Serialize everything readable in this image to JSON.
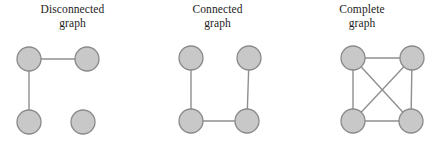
{
  "figure": {
    "background_color": "#ffffff",
    "node_fill_color": "#c8c8c8",
    "node_stroke_color": "#8a8a8a",
    "edge_color": "#8f8f8f",
    "node_radius": 12
  },
  "panels": [
    {
      "id": "disconnected",
      "title": "Disconnected\ngraph",
      "title_line1": "Disconnected",
      "title_line2": "graph",
      "nodes": [
        {
          "id": "tl",
          "cx": 29,
          "cy": 59
        },
        {
          "id": "tr",
          "cx": 87,
          "cy": 59
        },
        {
          "id": "bl",
          "cx": 29,
          "cy": 122
        },
        {
          "id": "br",
          "cx": 83,
          "cy": 122
        }
      ],
      "edges": [
        {
          "from": "tl",
          "to": "tr"
        },
        {
          "from": "tl",
          "to": "bl"
        }
      ],
      "edge_count": 2,
      "node_count": 4
    },
    {
      "id": "connected",
      "title": "Connected\ngraph",
      "title_line1": "Connected",
      "title_line2": "graph",
      "nodes": [
        {
          "id": "tl",
          "cx": 191,
          "cy": 58
        },
        {
          "id": "tr",
          "cx": 249,
          "cy": 58
        },
        {
          "id": "bl",
          "cx": 191,
          "cy": 121
        },
        {
          "id": "br",
          "cx": 247,
          "cy": 121
        }
      ],
      "edges": [
        {
          "from": "tl",
          "to": "bl"
        },
        {
          "from": "tr",
          "to": "br"
        },
        {
          "from": "bl",
          "to": "br"
        }
      ],
      "edge_count": 3,
      "node_count": 4
    },
    {
      "id": "complete",
      "title": "Complete\ngraph",
      "title_line1": "Complete",
      "title_line2": "graph",
      "nodes": [
        {
          "id": "tl",
          "cx": 353,
          "cy": 58
        },
        {
          "id": "tr",
          "cx": 412,
          "cy": 58
        },
        {
          "id": "bl",
          "cx": 353,
          "cy": 121
        },
        {
          "id": "br",
          "cx": 411,
          "cy": 121
        }
      ],
      "edges": [
        {
          "from": "tl",
          "to": "tr"
        },
        {
          "from": "tl",
          "to": "bl"
        },
        {
          "from": "tr",
          "to": "br"
        },
        {
          "from": "bl",
          "to": "br"
        },
        {
          "from": "tl",
          "to": "br"
        },
        {
          "from": "tr",
          "to": "bl"
        }
      ],
      "edge_count": 6,
      "node_count": 4
    }
  ],
  "panel_boxes": [
    {
      "left": 0,
      "width": 145
    },
    {
      "left": 145,
      "width": 145
    },
    {
      "left": 290,
      "width": 144
    }
  ]
}
